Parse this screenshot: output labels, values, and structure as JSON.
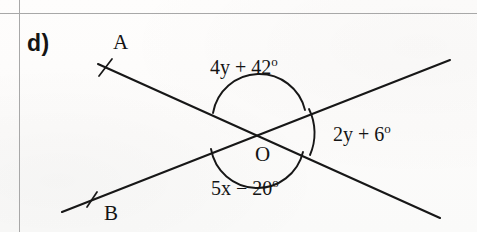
{
  "worksheet": {
    "part_label": "d)",
    "ruled_line_color": "#a8a8a8",
    "ink_color": "#141414",
    "background_color": "#fdfcfb"
  },
  "figure": {
    "caption_points": {
      "a_label": "A",
      "b_label": "B",
      "o_label": "O"
    },
    "angles": {
      "top": {
        "expr": "4y + 42",
        "degree": "o",
        "full": "4y + 42o"
      },
      "right": {
        "expr": "2y + 6",
        "degree": "o",
        "full": "2y + 6o"
      },
      "bottom": {
        "expr": "5x − 20",
        "degree": "o",
        "full": "5x − 20o"
      }
    },
    "geometry": {
      "intersection": {
        "x": 258,
        "y": 131
      },
      "line_a": {
        "x1": 98,
        "y1": 64,
        "x2": 440,
        "y2": 218,
        "tick_at": {
          "x": 105,
          "y": 67
        }
      },
      "line_b": {
        "x1": 62,
        "y1": 212,
        "x2": 450,
        "y2": 60,
        "tick_at": {
          "x": 92,
          "y": 200
        }
      },
      "arc_top_radius": 47,
      "arc_bottom_radius": 47,
      "arc_right_radius": 55
    }
  }
}
